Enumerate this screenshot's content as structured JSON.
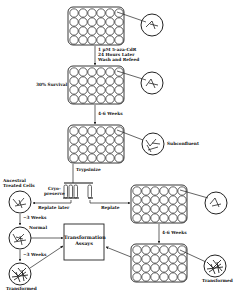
{
  "diagram": {
    "plate1_treatment": "1 μM 5-aza-CdR\n24 Hours Later\nWash and Refeed",
    "survival": "30% Survival",
    "weeks_4_6_top": "4-6 Weeks",
    "subconfluent": "Subconfluent",
    "trypsinize": "Trypsinize",
    "ancestral": "Ancestral\nTreated Cells",
    "cryopreserve": "Cryo-\npreserve",
    "replate_later": "Replate later",
    "replate": "Replate",
    "weeks_3_a": "~3 Weeks",
    "normal": "Normal",
    "weeks_3_b": "~3 Weeks",
    "transformed_left": "Transformed",
    "transformation_assays": "Transformation\nAssays",
    "weeks_4_6_right": "4-6 Weeks",
    "transformed_right": "Transformed"
  },
  "colors": {
    "line": "#222222",
    "background": "#ffffff"
  }
}
